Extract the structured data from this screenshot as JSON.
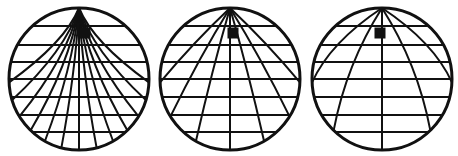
{
  "figure": {
    "background_color": "#ffffff",
    "line_color": "#111111",
    "marker_color": "#111111",
    "canvas": {
      "width": 458,
      "height": 156
    }
  },
  "chart_data": {
    "type": "diagram",
    "xlabel": "",
    "ylabel": "",
    "grid": true,
    "legend": "none",
    "globes": [
      {
        "id": "globe-1",
        "label": "Left globe",
        "center_x": 79,
        "center_y": 79,
        "radius_x": 70,
        "radius_y": 71,
        "outline_width": 3.0,
        "grid_width": 2.0,
        "pole_x": 79,
        "pole_y": 8,
        "pole_convergence": "tight",
        "meridian_count": 13,
        "meridian_spread": 0.2,
        "parallel_count": 7,
        "parallels_y": [
          26,
          45,
          62,
          79,
          97,
          115,
          132
        ],
        "marker": {
          "x": 85,
          "y": 33,
          "size": 11
        }
      },
      {
        "id": "globe-2",
        "label": "Middle globe",
        "center_x": 230,
        "center_y": 79,
        "radius_x": 70,
        "radius_y": 71,
        "outline_width": 3.0,
        "grid_width": 2.0,
        "pole_x": 230,
        "pole_y": 8,
        "pole_convergence": "medium",
        "meridian_count": 7,
        "meridian_spread": 0.52,
        "parallel_count": 7,
        "parallels_y": [
          26,
          45,
          62,
          79,
          97,
          115,
          132
        ],
        "marker": {
          "x": 233,
          "y": 33,
          "size": 11
        }
      },
      {
        "id": "globe-3",
        "label": "Right globe",
        "center_x": 382,
        "center_y": 79,
        "radius_x": 70,
        "radius_y": 71,
        "outline_width": 3.0,
        "grid_width": 2.0,
        "pole_x": 382,
        "pole_y": 8,
        "pole_convergence": "wide",
        "meridian_count": 5,
        "meridian_spread": 0.74,
        "parallel_count": 7,
        "parallels_y": [
          26,
          45,
          62,
          79,
          97,
          115,
          132
        ],
        "marker": {
          "x": 380,
          "y": 33,
          "size": 11
        }
      }
    ]
  }
}
